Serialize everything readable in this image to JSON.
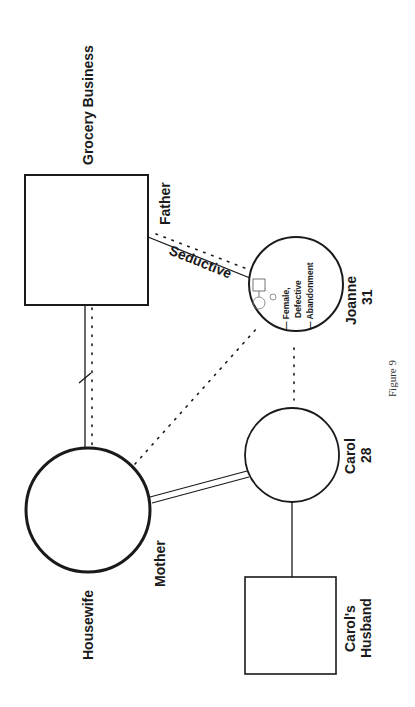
{
  "figure": {
    "caption": "Figure 9",
    "orientation": "rotated 90° clockwise (landscape page on portrait canvas)"
  },
  "nodes": {
    "father": {
      "shape": "square",
      "role_label": "Father",
      "occupation_label": "Grocery Business"
    },
    "mother": {
      "shape": "circle",
      "role_label": "Mother",
      "occupation_label": "Housewife"
    },
    "joanne": {
      "shape": "circle",
      "name": "Joanne",
      "age": "31",
      "notes": [
        "— Female,",
        "Defective",
        "— Abandonment"
      ]
    },
    "carol": {
      "shape": "circle",
      "name": "Carol",
      "age": "28"
    },
    "carols_husband": {
      "shape": "square",
      "name_line1": "Carol's",
      "name_line2": "Husband"
    }
  },
  "relationships": [
    {
      "from": "father",
      "to": "mother",
      "type": "marriage-with-separation-mark + dotted distant"
    },
    {
      "from": "father",
      "to": "joanne",
      "type": "solid + dotted",
      "label": "Seductive"
    },
    {
      "from": "mother",
      "to": "joanne",
      "type": "dotted"
    },
    {
      "from": "mother",
      "to": "carol",
      "type": "double line (close)"
    },
    {
      "from": "joanne",
      "to": "carol",
      "type": "dotted"
    },
    {
      "from": "carol",
      "to": "carols_husband",
      "type": "solid (marriage)"
    }
  ],
  "edge_labels": {
    "seductive": "Seductive"
  },
  "colors": {
    "ink": "#1a1a1a",
    "background": "#ffffff"
  }
}
